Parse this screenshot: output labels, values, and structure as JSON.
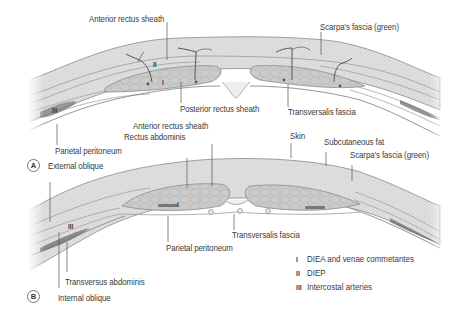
{
  "figure": {
    "panels": [
      {
        "id": "A",
        "badge": "A",
        "labels": {
          "anterior_rectus_sheath": "Anterior rectus sheath",
          "scarpas_fascia": "Scarpa's fascia (green)",
          "posterior_rectus_sheath": "Posterior rectus sheath",
          "transversalis_fascia": "Transversalis fascia",
          "parietal_peritoneum": "Parietal peritoneum",
          "external_oblique": "External oblique"
        },
        "markers": {
          "i": "I",
          "ii": "II",
          "iii": "III"
        }
      },
      {
        "id": "B",
        "badge": "B",
        "labels": {
          "anterior_rectus_sheath": "Anterior rectus sheath",
          "rectus_abdominis": "Rectus abdominis",
          "skin": "Skin",
          "subcutaneous_fat": "Subcutaneous fat",
          "scarpas_fascia": "Scarpa's fascia (green)",
          "transversalis_fascia": "Transversalis fascia",
          "parietal_peritoneum": "Parietal peritoneum",
          "transversus_abdominis": "Transversus abdominis",
          "internal_oblique": "Internal oblique"
        },
        "markers": {
          "i": "I",
          "iii": "III"
        }
      }
    ],
    "legend": [
      {
        "numeral": "I",
        "text": "DIEA and venae commetantes"
      },
      {
        "numeral": "II",
        "text": "DIEP"
      },
      {
        "numeral": "III",
        "text": "Intercostal arteries"
      }
    ],
    "colors": {
      "fat": "#dcdcdc",
      "fat_stipple": "#c4c4c4",
      "muscle": "#c9c9c9",
      "outline": "#8a8a8a",
      "fascia_line": "#9a9a9a",
      "vessel": "#555555",
      "leader_line": "#555555",
      "text": "#3a3a3a"
    }
  }
}
